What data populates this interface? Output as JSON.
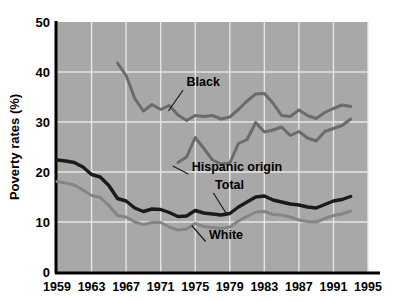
{
  "chart_data": {
    "type": "line",
    "title": "",
    "xlabel": "",
    "ylabel": "Poverty rates (%)",
    "xlim": [
      1959,
      1995
    ],
    "ylim": [
      0,
      50
    ],
    "grid": true,
    "legend": "inline-labels",
    "x_ticks": [
      "1959",
      "1963",
      "1967",
      "1971",
      "1975",
      "1979",
      "1983",
      "1987",
      "1991",
      "1995"
    ],
    "y_ticks": [
      "0",
      "10",
      "20",
      "30",
      "40",
      "50"
    ],
    "plot_background": "#a8a8a8",
    "gridline_color": "#e6e6e6",
    "series": [
      {
        "name": "Black",
        "color": "#6b6b6b",
        "label": "Black",
        "x": [
          1966,
          1967,
          1968,
          1969,
          1970,
          1971,
          1972,
          1973,
          1974,
          1975,
          1976,
          1977,
          1978,
          1979,
          1980,
          1981,
          1982,
          1983,
          1984,
          1985,
          1986,
          1987,
          1988,
          1989,
          1990,
          1991,
          1992,
          1993
        ],
        "values": [
          41.8,
          39.3,
          34.7,
          32.2,
          33.5,
          32.5,
          33.3,
          31.4,
          30.3,
          31.3,
          31.1,
          31.3,
          30.6,
          31.0,
          32.5,
          34.2,
          35.6,
          35.7,
          33.8,
          31.3,
          31.1,
          32.4,
          31.3,
          30.7,
          31.9,
          32.7,
          33.4,
          33.1
        ]
      },
      {
        "name": "Hispanic origin",
        "color": "#6b6b6b",
        "label": "Hispanic origin",
        "x": [
          1973,
          1974,
          1975,
          1976,
          1977,
          1978,
          1979,
          1980,
          1981,
          1982,
          1983,
          1984,
          1985,
          1986,
          1987,
          1988,
          1989,
          1990,
          1991,
          1992,
          1993
        ],
        "values": [
          21.9,
          23.0,
          26.9,
          24.7,
          22.4,
          21.6,
          21.8,
          25.7,
          26.5,
          29.9,
          28.0,
          28.4,
          29.0,
          27.3,
          28.1,
          26.8,
          26.2,
          28.1,
          28.7,
          29.3,
          30.6
        ]
      },
      {
        "name": "Total",
        "color": "#1a1a1a",
        "label": "Total",
        "x": [
          1959,
          1960,
          1961,
          1962,
          1963,
          1964,
          1965,
          1966,
          1967,
          1968,
          1969,
          1970,
          1971,
          1972,
          1973,
          1974,
          1975,
          1976,
          1977,
          1978,
          1979,
          1980,
          1981,
          1982,
          1983,
          1984,
          1985,
          1986,
          1987,
          1988,
          1989,
          1990,
          1991,
          1992,
          1993
        ],
        "values": [
          22.4,
          22.2,
          21.9,
          21.0,
          19.5,
          19.0,
          17.3,
          14.7,
          14.2,
          12.8,
          12.1,
          12.6,
          12.5,
          11.9,
          11.1,
          11.2,
          12.3,
          11.8,
          11.6,
          11.4,
          11.7,
          13.0,
          14.0,
          15.0,
          15.2,
          14.4,
          14.0,
          13.6,
          13.4,
          13.0,
          12.8,
          13.5,
          14.2,
          14.5,
          15.1
        ]
      },
      {
        "name": "White",
        "color": "#858585",
        "label": "White",
        "x": [
          1959,
          1960,
          1961,
          1962,
          1963,
          1964,
          1965,
          1966,
          1967,
          1968,
          1969,
          1970,
          1971,
          1972,
          1973,
          1974,
          1975,
          1976,
          1977,
          1978,
          1979,
          1980,
          1981,
          1982,
          1983,
          1984,
          1985,
          1986,
          1987,
          1988,
          1989,
          1990,
          1991,
          1992,
          1993
        ],
        "values": [
          18.1,
          17.8,
          17.4,
          16.4,
          15.3,
          14.9,
          13.3,
          11.3,
          11.0,
          10.0,
          9.5,
          9.9,
          9.9,
          9.0,
          8.4,
          8.6,
          9.7,
          9.1,
          8.9,
          8.7,
          9.0,
          10.2,
          11.1,
          12.0,
          12.1,
          11.5,
          11.4,
          11.0,
          10.4,
          10.1,
          10.0,
          10.7,
          11.3,
          11.6,
          12.2
        ]
      }
    ],
    "annotations": [
      {
        "text": "Black",
        "x": 1974.0,
        "y": 37.2
      },
      {
        "text": "Hispanic origin",
        "x": 1974.6,
        "y": 20.2
      },
      {
        "text": "Total",
        "x": 1977.3,
        "y": 16.6
      },
      {
        "text": "White",
        "x": 1976.6,
        "y": 6.6
      }
    ]
  }
}
